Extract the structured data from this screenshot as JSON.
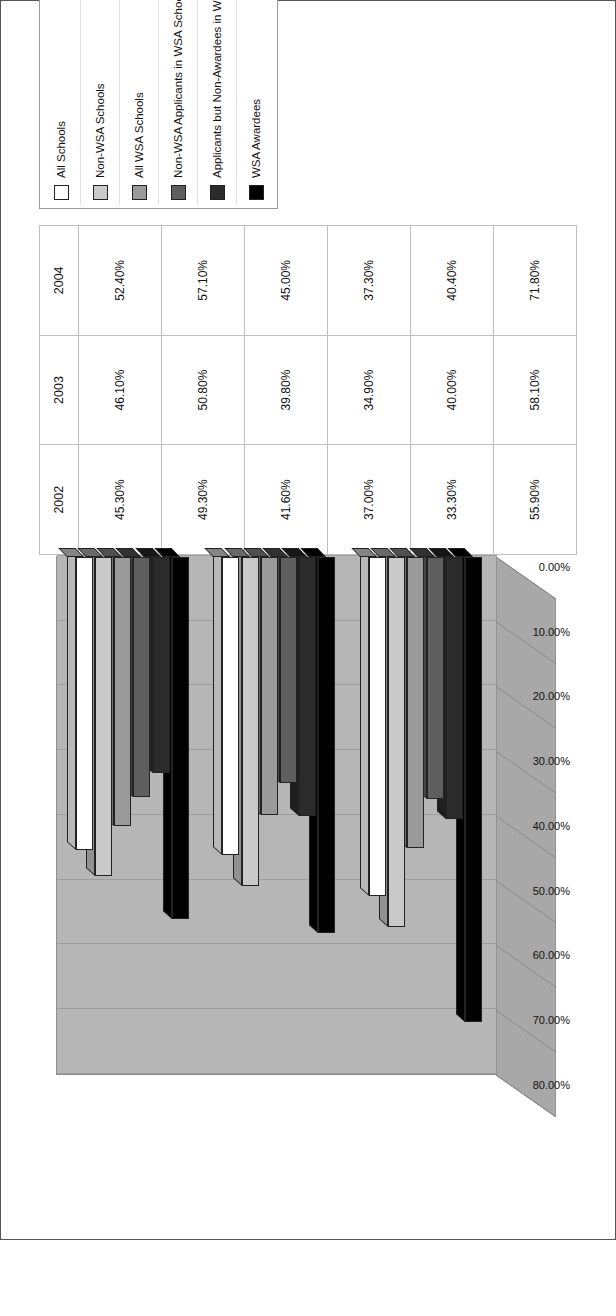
{
  "figure": {
    "title": "Figure 3 Trends in Percentages of Students Enrolling in AP/Honors/IB Courses"
  },
  "chart_data": {
    "type": "bar",
    "title": "Figure 3 Trends in Percentages of Students Enrolling in AP/Honors/IB Courses",
    "orientation": "vertical-3d-rotated",
    "xlabel": "",
    "ylabel": "",
    "categories": [
      "2002",
      "2003",
      "2004"
    ],
    "ylim": [
      0,
      80
    ],
    "yticks": [
      "0.00%",
      "10.00%",
      "20.00%",
      "30.00%",
      "40.00%",
      "50.00%",
      "60.00%",
      "70.00%",
      "80.00%"
    ],
    "grid": true,
    "legend_position": "right",
    "series": [
      {
        "name": "All Schools",
        "color": "#ffffff",
        "values": [
          45.3,
          46.1,
          52.4
        ],
        "labels": [
          "45.30%",
          "46.10%",
          "52.40%"
        ]
      },
      {
        "name": "Non-WSA Schools",
        "color": "#c9c9c9",
        "values": [
          49.3,
          50.8,
          57.1
        ],
        "labels": [
          "49.30%",
          "50.80%",
          "57.10%"
        ]
      },
      {
        "name": "All WSA Schools",
        "color": "#9a9a9a",
        "values": [
          41.6,
          39.8,
          45.0
        ],
        "labels": [
          "41.60%",
          "39.80%",
          "45.00%"
        ]
      },
      {
        "name": "Non-WSA Applicants in WSA Schools",
        "color": "#5e5e5e",
        "values": [
          37.0,
          34.9,
          37.3
        ],
        "labels": [
          "37.00%",
          "34.90%",
          "37.30%"
        ]
      },
      {
        "name": "Applicants but Non-Awardees in WSA Schools",
        "color": "#2b2b2b",
        "values": [
          33.3,
          40.0,
          40.4
        ],
        "labels": [
          "33.30%",
          "40.00%",
          "40.40%"
        ]
      },
      {
        "name": "WSA Awardees",
        "color": "#000000",
        "values": [
          55.9,
          58.1,
          71.8
        ],
        "labels": [
          "55.90%",
          "58.10%",
          "71.80%"
        ]
      }
    ]
  },
  "table": {
    "corner": "",
    "year_headers": [
      "2002",
      "2003",
      "2004"
    ],
    "rows": [
      {
        "label": "All Schools",
        "cells": [
          "45.30%",
          "46.10%",
          "52.40%"
        ]
      },
      {
        "label": "Non-WSA Schools",
        "cells": [
          "49.30%",
          "50.80%",
          "57.10%"
        ]
      },
      {
        "label": "All WSA Schools",
        "cells": [
          "41.60%",
          "39.80%",
          "45.00%"
        ]
      },
      {
        "label": "Non-WSA Applicants in WSA Schools",
        "cells": [
          "37.00%",
          "34.90%",
          "37.30%"
        ]
      },
      {
        "label": "Applicants but Non-Awardees in WSA Schools",
        "cells": [
          "33.30%",
          "40.00%",
          "40.40%"
        ]
      },
      {
        "label": "WSA Awardees",
        "cells": [
          "55.90%",
          "58.10%",
          "71.80%"
        ]
      }
    ]
  },
  "legend": {
    "items": [
      {
        "label": "All Schools",
        "color": "#ffffff"
      },
      {
        "label": "Non-WSA Schools",
        "color": "#c9c9c9"
      },
      {
        "label": "All WSA Schools",
        "color": "#9a9a9a"
      },
      {
        "label": "Non-WSA Applicants in WSA Schools",
        "color": "#5e5e5e"
      },
      {
        "label": "Applicants but Non-Awardees in WSA Schools",
        "color": "#2b2b2b"
      },
      {
        "label": "WSA Awardees",
        "color": "#000000"
      }
    ]
  },
  "colors": {
    "wall": "#b6b6b6",
    "floor": "#a8a8a8",
    "gridline": "#9d9d9d",
    "frame": "#555555"
  }
}
